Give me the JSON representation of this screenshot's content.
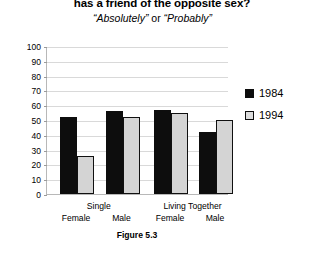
{
  "chart_data": {
    "type": "bar",
    "title": "has a friend of the opposite sex?",
    "subtitle_part1": "“Absolutely”",
    "subtitle_conjunction": " or ",
    "subtitle_part2": "“Probably”",
    "caption": "Figure 5.3",
    "xlabel": "",
    "ylabel": "",
    "ylim": [
      0,
      100
    ],
    "ytick_step": 10,
    "grid": true,
    "legend_position": "right",
    "categories": [
      "Female",
      "Male",
      "Female",
      "Male"
    ],
    "supercategories": [
      "Single",
      "Living Together"
    ],
    "yticks": [
      "100",
      "90",
      "80",
      "70",
      "60",
      "50",
      "40",
      "30",
      "20",
      "10",
      "0"
    ],
    "series": [
      {
        "name": "1984",
        "color": "#0d0d0d",
        "values": [
          52,
          56,
          57,
          42
        ]
      },
      {
        "name": "1994",
        "color": "#d4d4d4",
        "values": [
          26,
          52,
          55,
          50
        ]
      }
    ]
  }
}
